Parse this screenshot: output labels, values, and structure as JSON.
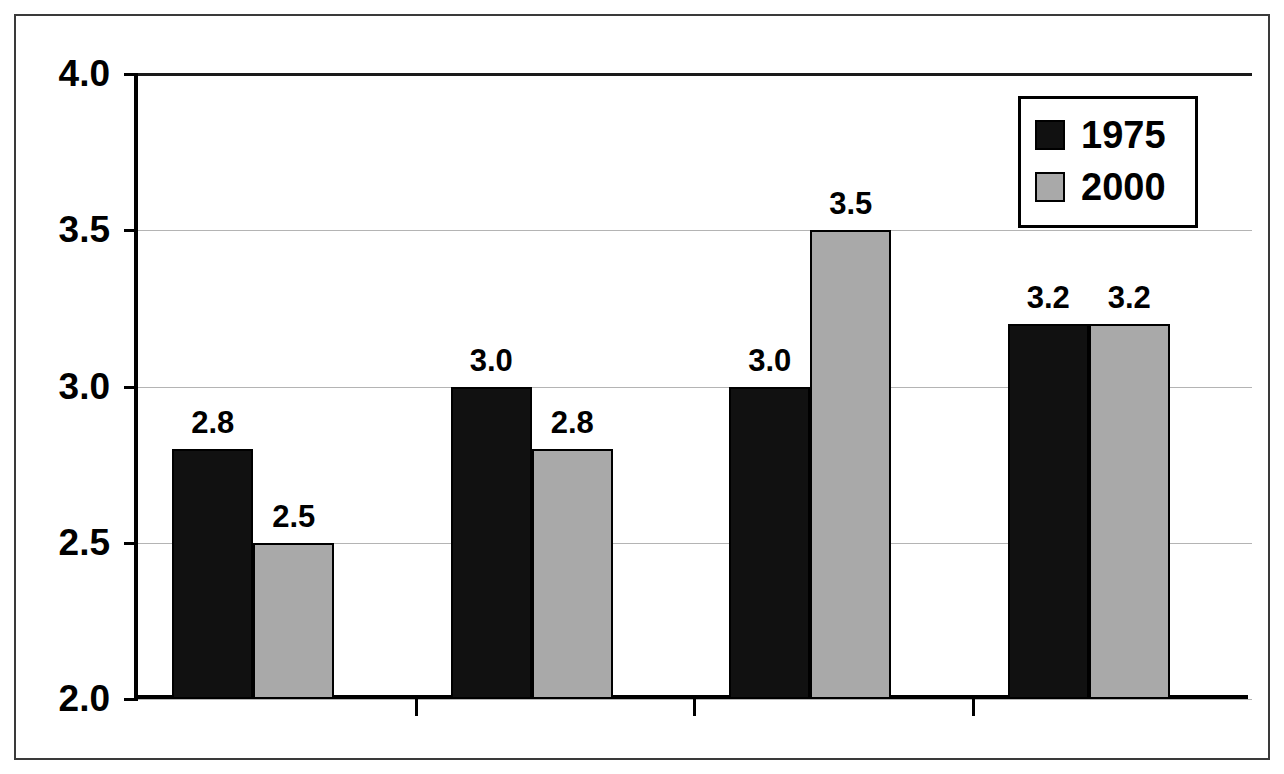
{
  "chart_data": {
    "type": "bar",
    "title": "",
    "subtitle": "",
    "xlabel": "",
    "ylabel": "",
    "categories": [
      "Whites",
      "Blacks",
      "Hispanics",
      "Asians"
    ],
    "series": [
      {
        "name": "1975",
        "color": "#111111",
        "values": [
          2.8,
          3.0,
          3.0,
          3.2
        ]
      },
      {
        "name": "2000",
        "color": "#a9a9a9",
        "values": [
          2.5,
          2.8,
          3.5,
          3.2
        ]
      }
    ],
    "value_labels": [
      [
        "2.8",
        "2.5"
      ],
      [
        "3.0",
        "2.8"
      ],
      [
        "3.0",
        "3.5"
      ],
      [
        "3.2",
        "3.2"
      ]
    ],
    "ylim": [
      2.0,
      4.0
    ],
    "yticks": [
      2.0,
      2.5,
      3.0,
      3.5,
      4.0
    ],
    "ytick_labels": [
      "2.0",
      "2.5",
      "3.0",
      "3.5",
      "4.0"
    ],
    "grid": true,
    "grid_axis": "y",
    "legend_position": "top-right",
    "legend_entries": [
      "1975",
      "2000"
    ]
  },
  "legend": {
    "entries": [
      {
        "label": "1975",
        "swatch": "black-square-icon"
      },
      {
        "label": "2000",
        "swatch": "gray-square-icon"
      }
    ]
  },
  "axes": {
    "y_labels": [
      "4.0",
      "3.5",
      "3.0",
      "2.5",
      "2.0"
    ],
    "x_labels": [
      "Whites",
      "Blacks",
      "Hispanics",
      "Asians"
    ]
  },
  "colors": {
    "series_1975": "#111111",
    "series_2000": "#a9a9a9",
    "gridline": "#b4b4b4",
    "axis": "#000000",
    "frame": "#3a3a3a",
    "background": "#ffffff"
  }
}
